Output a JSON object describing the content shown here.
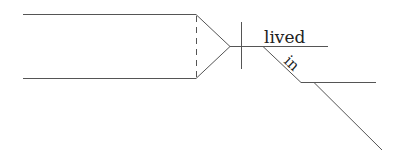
{
  "diagram": {
    "type": "sentence-diagram",
    "words": {
      "verb": "lived",
      "preposition": "in"
    },
    "colors": {
      "stroke": "#555555",
      "text": "#222222",
      "background": "#ffffff"
    }
  }
}
